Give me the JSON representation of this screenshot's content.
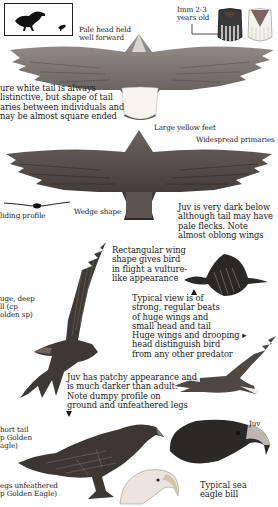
{
  "page": {
    "background": "#ffffff",
    "ink_color": "#1b1b1b"
  },
  "inset_box": {
    "label": "size comparison silhouettes",
    "items": [
      "large eagle silhouette",
      "small bird silhouette"
    ]
  },
  "captions": {
    "pale_head": "Pale head held\nwell forward",
    "imm_age": "Imm 2-3\nyears old",
    "white_tail": "ure white tail is always\nlistinctive, but shape of tail\naries between individuals and\nnay be almost square ended",
    "large_feet": "Large yellow feet",
    "widespread_primaries": "Widespread primaries",
    "gliding_profile": "liding profile",
    "wedge_shape": "Wedge shape",
    "juv_dark_below": "Juv is very dark below\nalthough tail may have\npale flecks. Note\nalmost oblong wings",
    "rectangular_wing": "Rectangular wing\nshape gives bird\nin flight a vulture-\nlike appearance",
    "huge_deep_bill": "uge, deep\nll (cp\nolden sp)",
    "typical_view": "Typical view is of\nstrong, regular beats\nof huge wings and\nsmall head and tail",
    "huge_wings": "Huge wings and drooping ▸\nhead distinguish bird\nfrom any other predator",
    "juv_patchy": "Juv has patchy appearance and\nis much darker than adult.\nNote dumpy profile on\nground and unfeathered legs",
    "short_tail": "hort tail\np Golden\nagle)",
    "legs_unfeathered": "egs unfeathered\np Golden Eagle)",
    "juv_head": "Juv",
    "sea_eagle_bill": "Typical sea\neagle bill"
  },
  "illustrations": [
    "adult-soaring-underside",
    "tail-imm-dark",
    "tail-imm-pale",
    "juv-soaring-underside",
    "gliding-profile-silhouette",
    "juv-banking-flight",
    "flapping-flight-distant",
    "adult-gliding-side",
    "juv-perched",
    "juv-head-portrait",
    "adult-head-portrait"
  ]
}
